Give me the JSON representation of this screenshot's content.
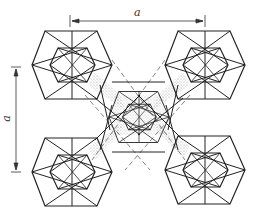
{
  "diagram": {
    "type": "crystal-structure-unit-cell",
    "labels": {
      "horizontal_dimension": "a",
      "vertical_dimension": "a"
    },
    "colors": {
      "line": "#222222",
      "dashed": "#555555",
      "stipple": "#999999",
      "background": "#ffffff"
    },
    "polyhedra": [
      {
        "name": "top-left",
        "cx": 72,
        "cy": 65
      },
      {
        "name": "top-right",
        "cx": 205,
        "cy": 65
      },
      {
        "name": "bottom-left",
        "cx": 72,
        "cy": 172
      },
      {
        "name": "bottom-right",
        "cx": 205,
        "cy": 170
      },
      {
        "name": "center",
        "cx": 139,
        "cy": 115
      }
    ]
  }
}
